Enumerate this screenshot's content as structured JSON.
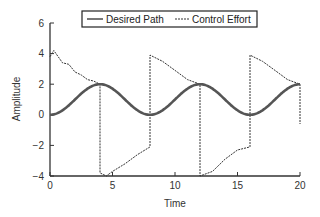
{
  "chart_data": {
    "type": "line",
    "title": "",
    "xlabel": "Time",
    "ylabel": "Amplitude",
    "xlim": [
      0,
      20
    ],
    "ylim": [
      -4,
      6
    ],
    "xticks": [
      0,
      5,
      10,
      15,
      20
    ],
    "yticks": [
      -4,
      -2,
      0,
      2,
      4,
      6
    ],
    "xtick_labels": [
      "0",
      "5",
      "10",
      "15",
      "20"
    ],
    "ytick_labels": [
      "−4",
      "−2",
      "0",
      "2",
      "4",
      "6"
    ],
    "grid": false,
    "legend_position": "top",
    "series": [
      {
        "name": "Desired Path",
        "style": "solid-thick",
        "color": "#555555",
        "formula": "1 - cos(pi*t/4)",
        "x": [
          0,
          1,
          2,
          3,
          4,
          5,
          6,
          7,
          8,
          9,
          10,
          11,
          12,
          13,
          14,
          15,
          16,
          17,
          18,
          19,
          20
        ],
        "values": [
          0,
          0.29,
          1,
          1.71,
          2,
          1.71,
          1,
          0.29,
          0,
          0.29,
          1,
          1.71,
          2,
          1.71,
          1,
          0.29,
          0,
          0.29,
          1,
          1.71,
          2
        ]
      },
      {
        "name": "Control Effort",
        "style": "dashed",
        "color": "#333333",
        "x": [
          0,
          0.3,
          1,
          1.5,
          2,
          2.5,
          3,
          3.5,
          4,
          4,
          4.5,
          5,
          6,
          7,
          8,
          8,
          9,
          10,
          11,
          12,
          12,
          13,
          14,
          15,
          16,
          16,
          17,
          18,
          19,
          20,
          20
        ],
        "values": [
          3.8,
          4.2,
          3.4,
          3.3,
          2.8,
          2.6,
          2.3,
          2.2,
          2.0,
          -3.8,
          -4.0,
          -3.7,
          -3.2,
          -2.6,
          -2.1,
          3.9,
          3.5,
          2.9,
          2.3,
          2.0,
          -4.0,
          -3.7,
          -2.9,
          -2.3,
          -2.1,
          3.9,
          3.5,
          2.9,
          2.3,
          2.0,
          -0.6
        ]
      }
    ]
  },
  "legend": {
    "items": [
      {
        "label": "Desired Path"
      },
      {
        "label": "Control Effort"
      }
    ]
  }
}
